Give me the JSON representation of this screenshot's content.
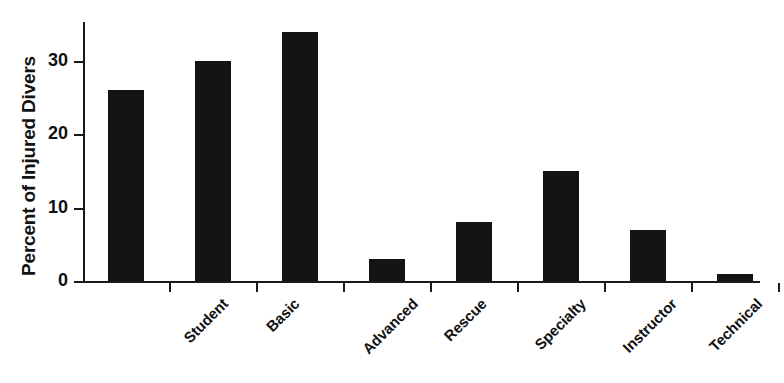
{
  "chart_data": {
    "type": "bar",
    "title": "",
    "xlabel": "",
    "ylabel": "Percent of Injured Divers",
    "categories": [
      "Student",
      "Basic",
      "Advanced",
      "Rescue",
      "Specialty",
      "Instructor",
      "Technical",
      "Commercial"
    ],
    "values": [
      26,
      30,
      34,
      3,
      8,
      15,
      7,
      1
    ],
    "ylim": [
      0,
      36
    ],
    "yticks": [
      0,
      10,
      20,
      30
    ],
    "ytick_labels": [
      "0",
      "10",
      "20",
      "30"
    ],
    "grid": false,
    "legend": null,
    "bar_color": "#141414",
    "axis_color": "#1a1a1a",
    "background_color": "#ffffff",
    "xtick_label_rotation": -45,
    "annotations": []
  }
}
